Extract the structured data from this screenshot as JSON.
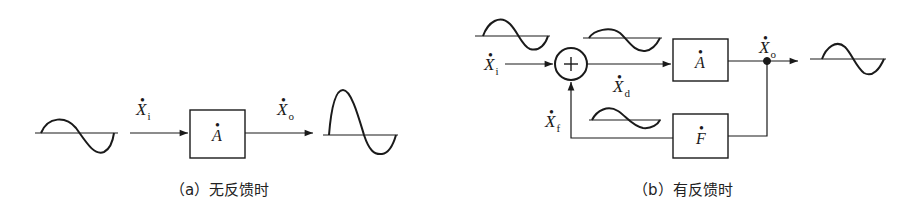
{
  "diagram_a": {
    "caption": "（a）无反馈时",
    "input_label": "X",
    "input_sub": "i",
    "output_label": "X",
    "output_sub": "o",
    "amplifier_label": "A",
    "dot": "•"
  },
  "diagram_b": {
    "caption": "（b）有反馈时",
    "input_label": "X",
    "input_sub": "i",
    "diff_label": "X",
    "diff_sub": "d",
    "output_label": "X",
    "output_sub": "o",
    "feedback_label": "X",
    "feedback_sub": "f",
    "amplifier_label": "A",
    "feedback_block_label": "F",
    "summer_symbol": "+",
    "dot": "•"
  },
  "colors": {
    "stroke": "#1a1a1a",
    "background": "#ffffff"
  }
}
